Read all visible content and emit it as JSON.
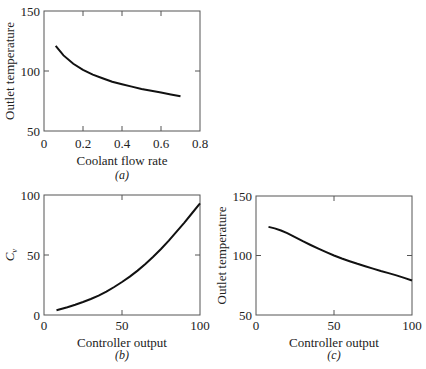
{
  "chart_data": [
    {
      "id": "a",
      "type": "line",
      "panel_label": "(a)",
      "title": "",
      "xlabel": "Coolant flow rate",
      "ylabel": "Outlet temperature",
      "xlim": [
        0,
        0.8
      ],
      "ylim": [
        50,
        150
      ],
      "xticks": [
        0,
        0.2,
        0.4,
        0.6,
        0.8
      ],
      "xtick_labels": [
        "0",
        "0.2",
        "0.4",
        "0.6",
        "0.8"
      ],
      "yticks": [
        50,
        100,
        150
      ],
      "ytick_labels": [
        "50",
        "100",
        "150"
      ],
      "grid": false,
      "x": [
        0.06,
        0.1,
        0.15,
        0.2,
        0.25,
        0.3,
        0.35,
        0.4,
        0.45,
        0.5,
        0.55,
        0.6,
        0.65,
        0.7
      ],
      "y": [
        121,
        113,
        106,
        101,
        97,
        94,
        91,
        89,
        87,
        85,
        83.5,
        82,
        80.5,
        79
      ]
    },
    {
      "id": "b",
      "type": "line",
      "panel_label": "(b)",
      "title": "",
      "xlabel": "Controller output",
      "ylabel": "Characteristic, C",
      "ylabel_subscript": "v",
      "xlim": [
        0,
        100
      ],
      "ylim": [
        0,
        100
      ],
      "xticks": [
        0,
        50,
        100
      ],
      "xtick_labels": [
        "0",
        "50",
        "100"
      ],
      "yticks": [
        0,
        50,
        100
      ],
      "ytick_labels": [
        "0",
        "50",
        "100"
      ],
      "grid": false,
      "x": [
        8,
        15,
        20,
        25,
        30,
        35,
        40,
        45,
        50,
        55,
        60,
        65,
        70,
        75,
        80,
        85,
        90,
        95,
        100
      ],
      "y": [
        4,
        6.5,
        8.5,
        10.8,
        13.3,
        16.2,
        19.5,
        23.3,
        27.5,
        32,
        37,
        42.5,
        48.5,
        55,
        62,
        69.5,
        77,
        85,
        93
      ]
    },
    {
      "id": "c",
      "type": "line",
      "panel_label": "(c)",
      "title": "",
      "xlabel": "Controller output",
      "ylabel": "Outlet temperature",
      "xlim": [
        0,
        100
      ],
      "ylim": [
        50,
        150
      ],
      "xticks": [
        0,
        50,
        100
      ],
      "xtick_labels": [
        "0",
        "50",
        "100"
      ],
      "yticks": [
        50,
        100,
        150
      ],
      "ytick_labels": [
        "50",
        "100",
        "150"
      ],
      "grid": false,
      "x": [
        8,
        12,
        16,
        20,
        25,
        30,
        35,
        40,
        45,
        50,
        55,
        60,
        65,
        70,
        75,
        80,
        85,
        90,
        95,
        100
      ],
      "y": [
        124,
        122.8,
        121,
        118.8,
        115.5,
        112,
        108.8,
        105.7,
        102.8,
        100,
        97.5,
        95.2,
        93,
        91,
        89,
        87,
        85.2,
        83.3,
        81.2,
        79
      ]
    }
  ],
  "layout": {
    "panels": [
      {
        "left": 44,
        "top": 11,
        "right": 200,
        "bottom": 131,
        "panel_label_y": 179,
        "xlabel_y": 165,
        "ticklabel_y": 148,
        "ylabel_x": 14
      },
      {
        "left": 44,
        "top": 195,
        "right": 200,
        "bottom": 315,
        "panel_label_y": 359,
        "xlabel_y": 347,
        "ticklabel_y": 330,
        "ylabel_x": 14
      },
      {
        "left": 256,
        "top": 196,
        "right": 412,
        "bottom": 315,
        "panel_label_y": 359,
        "xlabel_y": 347,
        "ticklabel_y": 330,
        "ylabel_x": 226
      }
    ]
  }
}
